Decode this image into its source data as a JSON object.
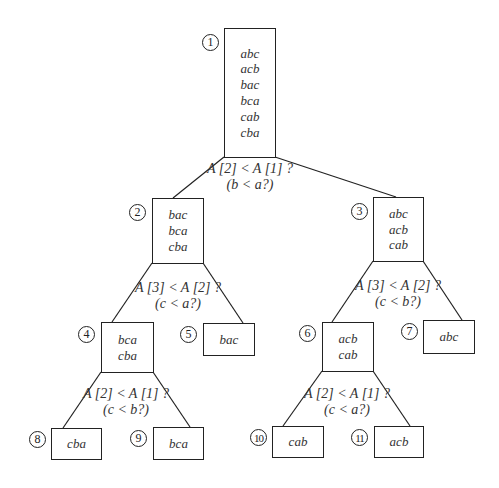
{
  "diagram": {
    "type": "decision-tree",
    "nodes": [
      {
        "id": "1",
        "perms": [
          "abc",
          "acb",
          "bac",
          "bca",
          "cab",
          "cba"
        ]
      },
      {
        "id": "2",
        "perms": [
          "bac",
          "bca",
          "cba"
        ]
      },
      {
        "id": "3",
        "perms": [
          "abc",
          "acb",
          "cab"
        ]
      },
      {
        "id": "4",
        "perms": [
          "bca",
          "cba"
        ]
      },
      {
        "id": "5",
        "perms": [
          "bac"
        ]
      },
      {
        "id": "6",
        "perms": [
          "acb",
          "cab"
        ]
      },
      {
        "id": "7",
        "perms": [
          "abc"
        ]
      },
      {
        "id": "8",
        "perms": [
          "cba"
        ]
      },
      {
        "id": "9",
        "perms": [
          "bca"
        ]
      },
      {
        "id": "10",
        "perms": [
          "cab"
        ]
      },
      {
        "id": "11",
        "perms": [
          "acb"
        ]
      }
    ],
    "questions": [
      {
        "at": "1",
        "line1": "A [2] < A [1] ?",
        "line2": "(b < a?)"
      },
      {
        "at": "2",
        "line1": "A [3] < A [2] ?",
        "line2": "(c < a?)"
      },
      {
        "at": "3",
        "line1": "A [3] < A [2] ?",
        "line2": "(c < b?)"
      },
      {
        "at": "4",
        "line1": "A [2] < A [1] ?",
        "line2": "(c < b?)"
      },
      {
        "at": "6",
        "line1": "A [2] < A [1] ?",
        "line2": "(c < a?)"
      }
    ],
    "edges": [
      [
        "1",
        "2"
      ],
      [
        "1",
        "3"
      ],
      [
        "2",
        "4"
      ],
      [
        "2",
        "5"
      ],
      [
        "3",
        "6"
      ],
      [
        "3",
        "7"
      ],
      [
        "4",
        "8"
      ],
      [
        "4",
        "9"
      ],
      [
        "6",
        "10"
      ],
      [
        "6",
        "11"
      ]
    ]
  }
}
